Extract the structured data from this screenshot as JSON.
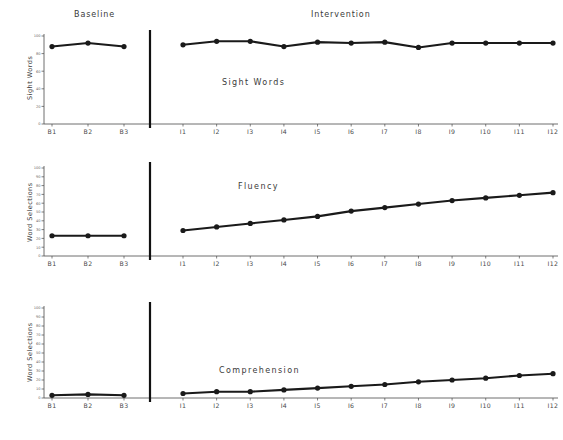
{
  "figure": {
    "phases": {
      "baseline_label": "Baseline",
      "intervention_label": "Intervention"
    },
    "panels": [
      {
        "id": "sight",
        "title": "Sight Words",
        "ylabel": "Sight Words"
      },
      {
        "id": "fluency",
        "title": "Fluency",
        "ylabel": "Word Selections"
      },
      {
        "id": "comprehension",
        "title": "Comprehension",
        "ylabel": "Word Selections"
      }
    ]
  },
  "chart_data": [
    {
      "type": "line",
      "title": "Sight Words",
      "xlabel": "",
      "ylabel": "Sight Words",
      "ylim": [
        0,
        100
      ],
      "yticks": [
        0,
        20,
        40,
        60,
        80,
        100
      ],
      "ytick_labels": [
        "0",
        "20",
        "40",
        "60",
        "80",
        "100"
      ],
      "grid": false,
      "legend": "none",
      "phases": [
        "Baseline",
        "Intervention"
      ],
      "series": [
        {
          "name": "Baseline",
          "x": [
            "B1",
            "B2",
            "B3"
          ],
          "values": [
            88,
            92,
            88
          ]
        },
        {
          "name": "Intervention",
          "x": [
            "I1",
            "I2",
            "I3",
            "I4",
            "I5",
            "I6",
            "I7",
            "I8",
            "I9",
            "I10",
            "I11",
            "I12"
          ],
          "values": [
            90,
            94,
            94,
            88,
            93,
            92,
            93,
            87,
            92,
            92,
            92,
            92
          ]
        }
      ]
    },
    {
      "type": "line",
      "title": "Fluency",
      "xlabel": "",
      "ylabel": "Word Selections",
      "ylim": [
        0,
        100
      ],
      "yticks": [
        0,
        10,
        20,
        30,
        40,
        50,
        60,
        70,
        80,
        90,
        100
      ],
      "ytick_labels": [
        "0",
        "10",
        "20",
        "30",
        "40",
        "50",
        "60",
        "70",
        "80",
        "90",
        "100"
      ],
      "grid": false,
      "legend": "none",
      "phases": [
        "Baseline",
        "Intervention"
      ],
      "series": [
        {
          "name": "Baseline",
          "x": [
            "B1",
            "B2",
            "B3"
          ],
          "values": [
            23,
            23,
            23
          ]
        },
        {
          "name": "Intervention",
          "x": [
            "I1",
            "I2",
            "I3",
            "I4",
            "I5",
            "I6",
            "I7",
            "I8",
            "I9",
            "I10",
            "I11",
            "I12"
          ],
          "values": [
            29,
            33,
            37,
            41,
            45,
            51,
            55,
            59,
            63,
            66,
            69,
            72
          ]
        }
      ]
    },
    {
      "type": "line",
      "title": "Comprehension",
      "xlabel": "",
      "ylabel": "Word Selections",
      "ylim": [
        0,
        100
      ],
      "yticks": [
        0,
        10,
        20,
        30,
        40,
        50,
        60,
        70,
        80,
        90,
        100
      ],
      "ytick_labels": [
        "0",
        "10",
        "20",
        "30",
        "40",
        "50",
        "60",
        "70",
        "80",
        "90",
        "100"
      ],
      "grid": false,
      "legend": "none",
      "phases": [
        "Baseline",
        "Intervention"
      ],
      "series": [
        {
          "name": "Baseline",
          "x": [
            "B1",
            "B2",
            "B3"
          ],
          "values": [
            3,
            4,
            3
          ]
        },
        {
          "name": "Intervention",
          "x": [
            "I1",
            "I2",
            "I3",
            "I4",
            "I5",
            "I6",
            "I7",
            "I8",
            "I9",
            "I10",
            "I11",
            "I12"
          ],
          "values": [
            5,
            7,
            7,
            9,
            11,
            13,
            15,
            18,
            20,
            22,
            25,
            27
          ]
        }
      ]
    }
  ]
}
